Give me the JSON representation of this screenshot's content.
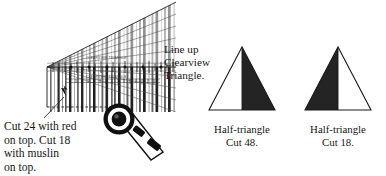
{
  "figure": {
    "background_color": "#ffffff",
    "ink_color": "#1a1a1a"
  },
  "captions": {
    "line_up": "Line up\nClearview\nTriangle.",
    "cut_instruction": "Cut 24 with red\non top. Cut 18\nwith muslin\non top.",
    "left_triangle": "Half-triangle\nCut 48.",
    "right_triangle": "Half-triangle\nCut 18."
  },
  "diagram": {
    "fabric": {
      "label": "striped-fabric-stack",
      "stripe_color_dark": "#2b2b2b",
      "stripe_color_mid": "#6e6e6e",
      "stripe_color_light": "#b4b4b4"
    },
    "ruler": {
      "label": "clearview-triangle-ruler",
      "microtext_top": "CLEARVIEW TRIANGLE",
      "microtext_bottom": "CLEARVIEW TRIANGLE"
    },
    "cut_piece": {
      "label": "cut-rectangle-outline"
    },
    "rotary_cutter": {
      "label": "rotary-cutter-tool",
      "blade_color": "#111111",
      "body_color": "#ffffff"
    },
    "shapes": [
      {
        "name": "half-triangle-cut-48",
        "filled_side": "right",
        "fill_color": "#242424",
        "outline_color": "#1a1a1a"
      },
      {
        "name": "half-triangle-cut-18",
        "filled_side": "left",
        "fill_color": "#242424",
        "outline_color": "#1a1a1a"
      }
    ]
  }
}
